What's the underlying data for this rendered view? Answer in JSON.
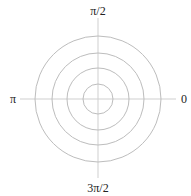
{
  "diagram": {
    "type": "polar-grid",
    "center": {
      "x": 98,
      "y": 99
    },
    "ring_radii_px": [
      15,
      31,
      46,
      63
    ],
    "axis_labels": {
      "right": "0",
      "top": "π/2",
      "left": "π",
      "bottom": "3π/2"
    },
    "colors": {
      "rings": "#bdbdbd",
      "axes": "#cfcfcf",
      "labels": "#222222"
    }
  }
}
